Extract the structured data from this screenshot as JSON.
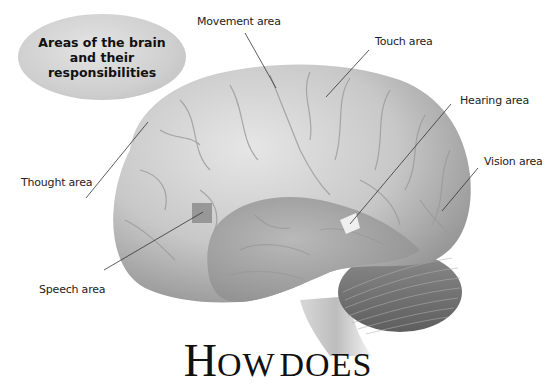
{
  "callout": {
    "title": "Areas of the brain and their responsibilities"
  },
  "labels": {
    "movement": "Movement area",
    "touch": "Touch area",
    "hearing": "Hearing area",
    "vision": "Vision area",
    "thought": "Thought area",
    "speech": "Speech area"
  },
  "title": {
    "first_letter": "H",
    "rest_of_word": "OW",
    "second_word": "DOES"
  },
  "colors": {
    "callout_fill": "#cfcfcf",
    "cerebrum": "#c9c9c9",
    "cerebellum": "#7c7c7c",
    "speech_highlight": "#8d8d8d",
    "hearing_highlight": "#ececec",
    "text": "#111111"
  }
}
